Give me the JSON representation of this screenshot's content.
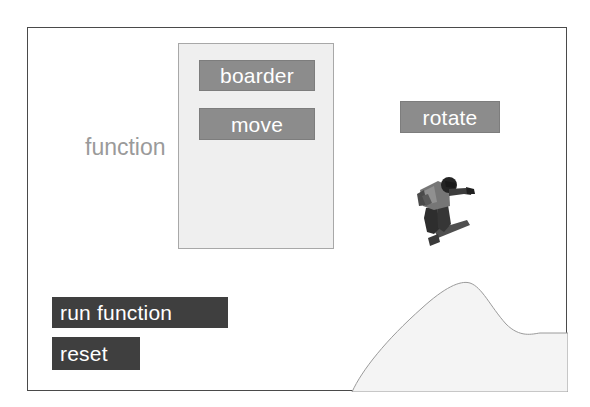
{
  "canvas": {
    "background_color": "#ffffff",
    "border_color": "#4a4a4a"
  },
  "function_label": {
    "text": "function",
    "color": "#9a9a9a"
  },
  "function_panel": {
    "background_color": "#efefef",
    "border_color": "#a8a8a8",
    "blocks": [
      {
        "label": "boarder",
        "color": "#8c8c8c",
        "text_color": "#ffffff"
      },
      {
        "label": "move",
        "color": "#8c8c8c",
        "text_color": "#ffffff"
      }
    ]
  },
  "palette_blocks": [
    {
      "label": "rotate",
      "color": "#8c8c8c",
      "text_color": "#ffffff"
    }
  ],
  "action_buttons": [
    {
      "label": "run function",
      "color": "#3f3f3f",
      "text_color": "#ffffff"
    },
    {
      "label": "reset",
      "color": "#3f3f3f",
      "text_color": "#ffffff"
    }
  ],
  "stage_objects": {
    "snowboarder": {
      "name": "snowboarder-sprite",
      "description": "crouching snowboarder on board"
    },
    "ramp": {
      "name": "ramp-hill",
      "fill_color": "#f4f4f4",
      "outline_color": "#9a9a9a"
    }
  }
}
